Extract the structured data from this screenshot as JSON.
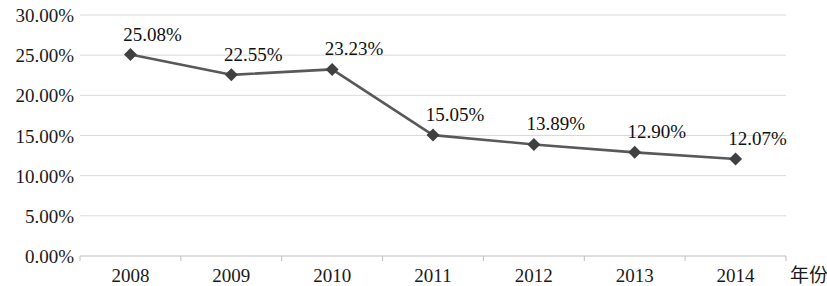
{
  "chart_data": {
    "type": "line",
    "title": "",
    "subtitle": "",
    "xlabel": "年份",
    "ylabel": "",
    "categories": [
      "2008",
      "2009",
      "2010",
      "2011",
      "2012",
      "2013",
      "2014"
    ],
    "values": [
      25.08,
      22.55,
      23.23,
      15.05,
      13.89,
      12.9,
      12.07
    ],
    "point_labels": [
      "25.08%",
      "22.55%",
      "23.23%",
      "15.05%",
      "13.89%",
      "12.90%",
      "12.07%"
    ],
    "y_tick_labels": [
      "30.00%",
      "25.00%",
      "20.00%",
      "15.00%",
      "10.00%",
      "5.00%",
      "0.00%"
    ],
    "y_tick_values": [
      30,
      25,
      20,
      15,
      10,
      5,
      0
    ],
    "ylim": [
      0,
      30
    ],
    "grid": true,
    "legend": false,
    "legend_position": "none",
    "series": [
      {
        "name": "",
        "values": [
          25.08,
          22.55,
          23.23,
          15.05,
          13.89,
          12.9,
          12.07
        ]
      }
    ],
    "colors": {
      "line": "#595959",
      "marker": "#404040",
      "grid": "#d9d9d9",
      "axis": "#bfbfbf",
      "text": "#1a1a1a",
      "background": "#ffffff"
    },
    "marker_shape": "diamond"
  }
}
